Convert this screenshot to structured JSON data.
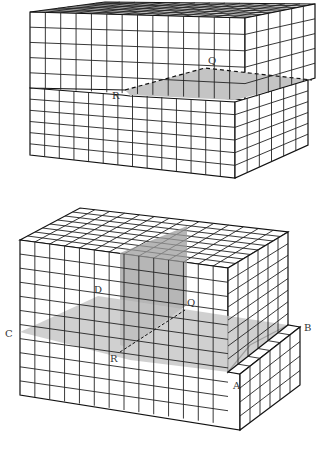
{
  "figure": {
    "type": "geological block diagrams",
    "panels": [
      {
        "id": "top",
        "description": "Faulted block with upper block displaced, exposing shaded fault plane",
        "labels": [
          {
            "text": "Q",
            "x": 210,
            "y": 63
          },
          {
            "text": "R",
            "x": 113,
            "y": 99
          }
        ]
      },
      {
        "id": "bottom",
        "description": "Block with intersecting shaded planes and stepped front corner",
        "labels": [
          {
            "text": "D",
            "x": 94,
            "y": 293
          },
          {
            "text": "Q",
            "x": 188,
            "y": 306
          },
          {
            "text": "C",
            "x": 8,
            "y": 338
          },
          {
            "text": "B",
            "x": 307,
            "y": 330
          },
          {
            "text": "R",
            "x": 111,
            "y": 362
          },
          {
            "text": "A",
            "x": 234,
            "y": 388
          }
        ]
      }
    ],
    "colors": {
      "line": "#222222",
      "shade_light": "#c8c8c8",
      "shade_dark": "#9a9a9a",
      "background": "#ffffff"
    }
  }
}
